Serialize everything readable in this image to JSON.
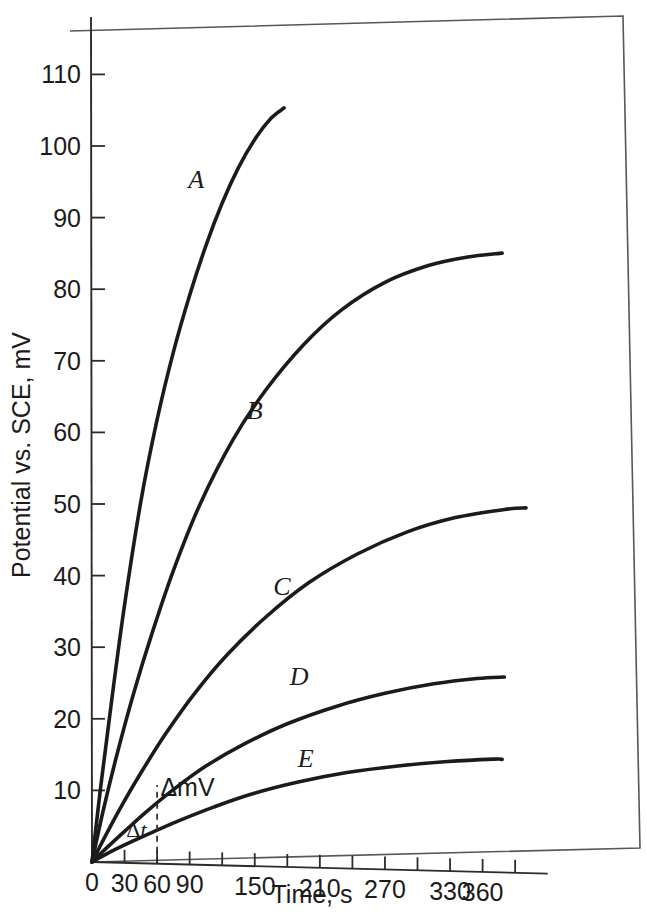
{
  "figure": {
    "background_color": "#ffffff",
    "ink_color": "#1b1b1b",
    "frame_color": "#53585c"
  },
  "chart_data": {
    "type": "line",
    "title": "",
    "xlabel": "Time, s",
    "ylabel": "Potential vs. SCE, mV",
    "xlim": [
      0,
      420
    ],
    "ylim": [
      0,
      118
    ],
    "grid": false,
    "legend_position": "inline-curve-labels",
    "xticks": [
      0,
      30,
      60,
      90,
      120,
      150,
      180,
      210,
      240,
      270,
      300,
      330,
      360,
      390
    ],
    "xtick_labels": [
      "0",
      "30",
      "60",
      "90",
      "",
      "150",
      "",
      "210",
      "",
      "270",
      "",
      "330",
      "360",
      ""
    ],
    "yticks": [
      10,
      20,
      30,
      40,
      50,
      60,
      70,
      80,
      90,
      100,
      110
    ],
    "ytick_labels": [
      "10",
      "20",
      "30",
      "40",
      "50",
      "60",
      "70",
      "80",
      "90",
      "100",
      "110"
    ],
    "series": [
      {
        "name": "A",
        "label": "A",
        "label_x": 96,
        "label_y": 94.5,
        "x": [
          0,
          8,
          18,
          30,
          45,
          60,
          75,
          90,
          105,
          120,
          135,
          150,
          165,
          177
        ],
        "y": [
          0,
          10.5,
          22.5,
          36.0,
          50.5,
          62.0,
          71.5,
          79.5,
          86.5,
          92.5,
          97.5,
          101.5,
          104.5,
          106.0
        ]
      },
      {
        "name": "B",
        "label": "B",
        "label_x": 150,
        "label_y": 62.5,
        "x": [
          0,
          10,
          22,
          38,
          55,
          75,
          100,
          130,
          160,
          195,
          230,
          270,
          310,
          345,
          378
        ],
        "y": [
          0,
          7.0,
          14.5,
          23.5,
          32.0,
          41.0,
          50.5,
          59.5,
          66.5,
          73.0,
          78.0,
          82.0,
          84.5,
          85.8,
          86.5
        ]
      },
      {
        "name": "C",
        "label": "C",
        "label_x": 175,
        "label_y": 38.0,
        "x": [
          0,
          12,
          26,
          45,
          68,
          95,
          125,
          160,
          200,
          245,
          290,
          335,
          380,
          400
        ],
        "y": [
          0,
          3.6,
          7.6,
          12.6,
          18.2,
          24.0,
          29.5,
          34.8,
          39.8,
          44.0,
          47.2,
          49.4,
          50.7,
          51.0
        ]
      },
      {
        "name": "D",
        "label": "D",
        "label_x": 191,
        "label_y": 25.5,
        "x": [
          0,
          14,
          30,
          50,
          75,
          105,
          140,
          180,
          225,
          270,
          315,
          355,
          380
        ],
        "y": [
          0,
          2.1,
          4.4,
          7.2,
          10.4,
          13.8,
          17.0,
          20.0,
          22.6,
          24.6,
          26.1,
          27.0,
          27.3
        ]
      },
      {
        "name": "E",
        "label": "E",
        "label_x": 197,
        "label_y": 14.0,
        "x": [
          0,
          16,
          34,
          56,
          82,
          112,
          148,
          190,
          235,
          282,
          328,
          370,
          378
        ],
        "y": [
          0,
          1.4,
          2.8,
          4.4,
          6.2,
          8.1,
          10.1,
          11.9,
          13.4,
          14.5,
          15.3,
          15.8,
          15.8
        ]
      }
    ],
    "annotations": [
      {
        "name": "delta-t",
        "prefix": "Δ",
        "symbol": "t",
        "text": "Δt",
        "x": 41,
        "y": 3.6
      },
      {
        "name": "delta-mv",
        "text": "ΔmV",
        "x": 88,
        "y": 9.5
      },
      {
        "name": "delta-guide-line",
        "text": "",
        "x": 60,
        "y": 0
      }
    ],
    "guide_line": {
      "x": 60,
      "y_top": 11.0,
      "y_bottom": 0
    }
  }
}
